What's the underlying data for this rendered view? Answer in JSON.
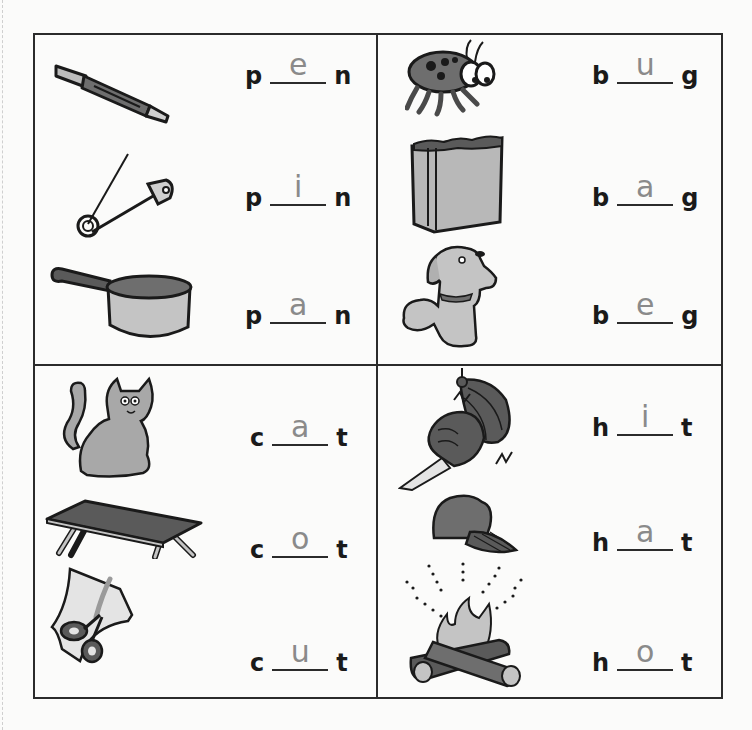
{
  "worksheet": {
    "quadrants": [
      {
        "id": "p_n",
        "items": [
          {
            "picture": "pen",
            "first": "p",
            "answer": "e",
            "last": "n"
          },
          {
            "picture": "safety pin",
            "first": "p",
            "answer": "i",
            "last": "n"
          },
          {
            "picture": "pan",
            "first": "p",
            "answer": "a",
            "last": "n"
          }
        ]
      },
      {
        "id": "b_g",
        "items": [
          {
            "picture": "bug",
            "first": "b",
            "answer": "u",
            "last": "g"
          },
          {
            "picture": "bag",
            "first": "b",
            "answer": "a",
            "last": "g"
          },
          {
            "picture": "dog begging",
            "first": "b",
            "answer": "e",
            "last": "g"
          }
        ]
      },
      {
        "id": "c_t",
        "items": [
          {
            "picture": "cat",
            "first": "c",
            "answer": "a",
            "last": "t"
          },
          {
            "picture": "cot",
            "first": "c",
            "answer": "o",
            "last": "t"
          },
          {
            "picture": "scissors cutting paper",
            "first": "c",
            "answer": "u",
            "last": "t"
          }
        ]
      },
      {
        "id": "h_t",
        "items": [
          {
            "picture": "fist hitting punching bag",
            "first": "h",
            "answer": "i",
            "last": "t"
          },
          {
            "picture": "hat",
            "first": "h",
            "answer": "a",
            "last": "t"
          },
          {
            "picture": "campfire",
            "first": "h",
            "answer": "o",
            "last": "t"
          }
        ]
      }
    ]
  },
  "colors": {
    "ink": "#1a1a1a",
    "pencil": "#8a8a8a",
    "illustration_gray": "#7a7a7a",
    "illustration_light": "#b8b8b8"
  }
}
